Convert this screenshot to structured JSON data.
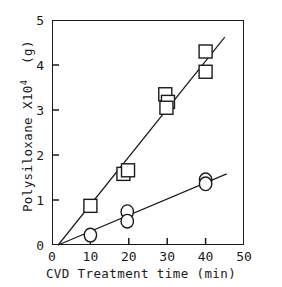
{
  "chart_data": {
    "type": "scatter",
    "title": "",
    "xlabel": "CVD Treatment time  (min)",
    "ylabel_text": "Polysiloxane X10",
    "ylabel_exp": "4",
    "ylabel_unit": "(g)",
    "xlim": [
      0,
      50
    ],
    "ylim": [
      0,
      5
    ],
    "xticks": [
      0,
      10,
      20,
      30,
      40,
      50
    ],
    "xtick_labels": [
      "0",
      "10",
      "20",
      "30",
      "40",
      "50"
    ],
    "yticks": [
      0,
      1,
      2,
      3,
      4,
      5
    ],
    "ytick_labels": [
      "0",
      "1",
      "2",
      "3",
      "4",
      "5"
    ],
    "grid": false,
    "legend": "none",
    "series": [
      {
        "name": "square-series",
        "marker": "square",
        "points": [
          {
            "x": 10.0,
            "y": 0.87
          },
          {
            "x": 18.6,
            "y": 1.58
          },
          {
            "x": 19.8,
            "y": 1.66
          },
          {
            "x": 29.5,
            "y": 3.35
          },
          {
            "x": 30.2,
            "y": 3.18
          },
          {
            "x": 29.8,
            "y": 3.05
          },
          {
            "x": 40.0,
            "y": 4.3
          },
          {
            "x": 40.0,
            "y": 3.85
          }
        ],
        "fit_line": {
          "x0": 1.6,
          "y0": 0.0,
          "x1": 45.0,
          "y1": 4.62
        }
      },
      {
        "name": "circle-series",
        "marker": "circle",
        "points": [
          {
            "x": 10.0,
            "y": 0.22
          },
          {
            "x": 19.6,
            "y": 0.74
          },
          {
            "x": 19.6,
            "y": 0.53
          },
          {
            "x": 40.0,
            "y": 1.45
          },
          {
            "x": 40.0,
            "y": 1.36
          }
        ],
        "fit_line": {
          "x0": 1.6,
          "y0": 0.0,
          "x1": 45.5,
          "y1": 1.58
        }
      }
    ]
  }
}
